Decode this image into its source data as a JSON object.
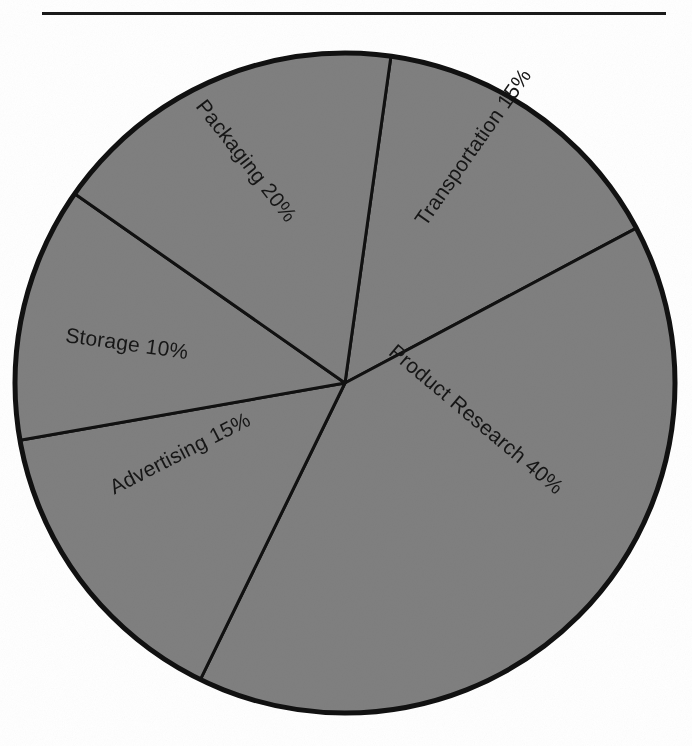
{
  "figure": {
    "title": "",
    "has_top_rule": true,
    "background_color": "#ffffff",
    "slice_fill_color": "#808080",
    "outline_color": "#111111",
    "label_color": "#161616"
  },
  "chart_data": {
    "type": "pie",
    "title": "",
    "xlabel": "",
    "ylabel": "",
    "grid": false,
    "legend": "none",
    "labels_inside_slices": true,
    "units": "percent",
    "total": 100,
    "categories": [
      "Transportation",
      "Product Research",
      "Advertising",
      "Storage",
      "Packaging"
    ],
    "values": [
      15,
      40,
      15,
      10,
      20
    ],
    "slices": [
      {
        "name": "Transportation",
        "value": 15,
        "label": "Transportation 15%",
        "percent_text": "15%",
        "start_angle_deg": 8,
        "end_angle_deg": 62,
        "label_rotation_deg": -55,
        "label_left_px": 383,
        "label_top_px": 140,
        "label_width_px": 176
      },
      {
        "name": "Product Research",
        "value": 40,
        "label": "Product Research 40%",
        "percent_text": "40%",
        "start_angle_deg": 62,
        "end_angle_deg": 206,
        "label_rotation_deg": 40,
        "label_left_px": 365,
        "label_top_px": 410,
        "label_width_px": 226
      },
      {
        "name": "Advertising",
        "value": 15,
        "label": "Advertising 15%",
        "percent_text": "15%",
        "start_angle_deg": 206,
        "end_angle_deg": 260,
        "label_rotation_deg": -27,
        "label_left_px": 103,
        "label_top_px": 442,
        "label_width_px": 156
      },
      {
        "name": "Storage",
        "value": 10,
        "label": "Storage 10%",
        "percent_text": "10%",
        "start_angle_deg": 260,
        "end_angle_deg": 305,
        "label_rotation_deg": 8,
        "label_left_px": 65,
        "label_top_px": 333,
        "label_width_px": 130
      },
      {
        "name": "Packaging",
        "value": 20,
        "label": "Packaging 20%",
        "percent_text": "20%",
        "start_angle_deg": 305,
        "end_angle_deg": 368,
        "label_rotation_deg": 52,
        "label_left_px": 171,
        "label_top_px": 150,
        "label_width_px": 150
      }
    ],
    "geometry": {
      "center_x": 345,
      "center_y": 383,
      "radius": 330
    }
  }
}
